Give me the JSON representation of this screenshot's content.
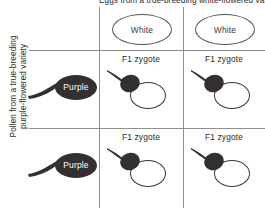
{
  "diagram": {
    "column_axis_label": "Eggs from a true-breeding white-flowered variety",
    "row_axis_label_line1": "Pollen from a true-breeding",
    "row_axis_label_line2": "purple-flowered variety",
    "colors": {
      "gamete_fill": "#332f33",
      "gamete_text": "#ffffff",
      "outline": "#3a3a3a",
      "grid_line": "#8e8e8e",
      "text": "#2b2b2b",
      "background": "#ffffff"
    },
    "column_gametes": [
      {
        "label": "White",
        "type": "egg"
      },
      {
        "label": "White",
        "type": "egg"
      }
    ],
    "row_gametes": [
      {
        "label": "Purple",
        "type": "pollen"
      },
      {
        "label": "Purple",
        "type": "pollen"
      }
    ],
    "cells": [
      {
        "label": "F1 zygote"
      },
      {
        "label": "F1 zygote"
      },
      {
        "label": "F1 zygote"
      },
      {
        "label": "F1 zygote"
      }
    ]
  }
}
